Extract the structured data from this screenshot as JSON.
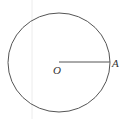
{
  "diagram": {
    "type": "circle-with-radius",
    "center_label": "O",
    "point_label": "A",
    "colors": {
      "stroke": "#555555",
      "guide": "#e6e6e6",
      "text": "#333333"
    }
  }
}
